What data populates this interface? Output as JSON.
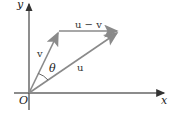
{
  "diagram": {
    "title": "",
    "axes": {
      "x_label": "x",
      "y_label": "y",
      "origin_label": "O"
    },
    "vectors": [
      {
        "name": "v",
        "label": "v",
        "from": "O",
        "to": "tip_v"
      },
      {
        "name": "u",
        "label": "u",
        "from": "O",
        "to": "tip_u"
      },
      {
        "name": "u_minus_v",
        "label": "u − v",
        "from": "tip_v",
        "to": "tip_u"
      }
    ],
    "angle": {
      "label": "θ",
      "between": [
        "v",
        "u"
      ]
    },
    "colors": {
      "axis": "#555555",
      "vector": "#8a8a8a",
      "text": "#222222"
    }
  }
}
